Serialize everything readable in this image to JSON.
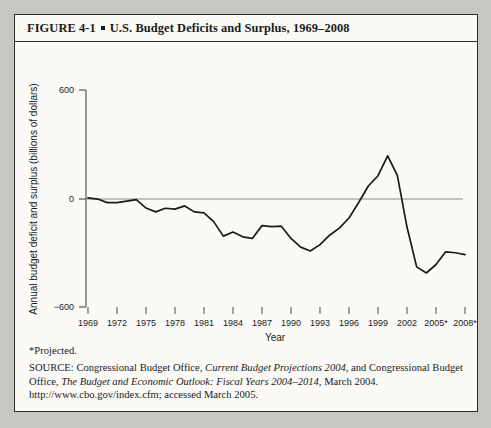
{
  "figure": {
    "number": "FIGURE  4-1",
    "title": "U.S. Budget Deficits and Surplus, 1969–2008",
    "bullet": "▪"
  },
  "footnotes": {
    "projected": "*Projected.",
    "source_prefix": "SOURCE: Congressional Budget Office, ",
    "source_italic1": "Current Budget Projections 2004",
    "source_mid": ", and Congressional Budget Office, ",
    "source_italic2": "The Budget and Economic Outlook: Fiscal Years 2004–2014",
    "source_suffix": ", March 2004. http://www.cbo.gov/index.cfm; accessed March 2005."
  },
  "chart_data": {
    "type": "line",
    "title": "U.S. Budget Deficits and Surplus, 1969–2008",
    "xlabel": "Year",
    "ylabel": "Annual budget deficit and surplus (billions of dollars)",
    "xlim": [
      1969,
      2008
    ],
    "ylim": [
      -600,
      600
    ],
    "yticks": [
      600,
      0,
      -600
    ],
    "yticklabels": [
      "600",
      "0",
      "−600"
    ],
    "xticks": [
      1969,
      1972,
      1975,
      1978,
      1981,
      1984,
      1987,
      1990,
      1993,
      1996,
      1999,
      2002,
      2005,
      2008
    ],
    "xticklabels": [
      "1969",
      "1972",
      "1975",
      "1978",
      "1981",
      "1984",
      "1987",
      "1990",
      "1993",
      "1996",
      "1999",
      "2002",
      "2005*",
      "2008*"
    ],
    "grid": false,
    "legend": false,
    "zero_line": true,
    "series": [
      {
        "name": "Annual budget deficit and surplus",
        "color": "#1a1a1a",
        "x": [
          1969,
          1970,
          1971,
          1972,
          1973,
          1974,
          1975,
          1976,
          1977,
          1978,
          1979,
          1980,
          1981,
          1982,
          1983,
          1984,
          1985,
          1986,
          1987,
          1988,
          1989,
          1990,
          1991,
          1992,
          1993,
          1994,
          1995,
          1996,
          1997,
          1998,
          1999,
          2000,
          2001,
          2002,
          2003,
          2004,
          2005,
          2006,
          2007,
          2008
        ],
        "values": [
          3,
          -3,
          -23,
          -23,
          -15,
          -6,
          -53,
          -74,
          -54,
          -59,
          -41,
          -74,
          -79,
          -128,
          -208,
          -185,
          -212,
          -221,
          -150,
          -155,
          -153,
          -221,
          -269,
          -290,
          -255,
          -203,
          -164,
          -108,
          -22,
          69,
          126,
          236,
          128,
          -158,
          -378,
          -412,
          -365,
          -295,
          -300,
          -310
        ]
      }
    ],
    "annotations": [
      {
        "label": "peak surplus",
        "year": 2000,
        "value": 236
      },
      {
        "label": "deepest deficit",
        "year": 2004,
        "value": -412
      }
    ]
  }
}
